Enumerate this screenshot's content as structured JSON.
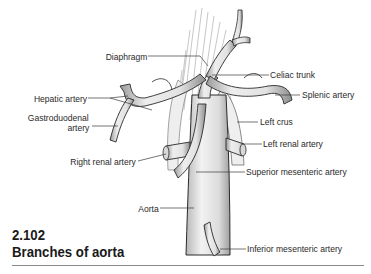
{
  "figure": {
    "number": "2.102",
    "title": "Branches of aorta"
  },
  "labels": {
    "diaphragm": "Diaphragm",
    "celiac_trunk": "Celiac trunk",
    "hepatic_artery": "Hepatic artery",
    "splenic_artery": "Splenic artery",
    "gastroduodenal_artery_line1": "Gastroduodenal",
    "gastroduodenal_artery_line2": "artery",
    "left_crus": "Left crus",
    "left_renal_artery": "Left renal artery",
    "right_renal_artery": "Right renal artery",
    "superior_mesenteric_artery": "Superior mesenteric artery",
    "aorta": "Aorta",
    "inferior_mesenteric_artery": "Inferior mesenteric artery"
  },
  "colors": {
    "vessel_fill": "#e4e4e4",
    "vessel_outline": "#2a2a2a",
    "text": "#2a2a2a",
    "leader_line": "#3a3a3a"
  }
}
